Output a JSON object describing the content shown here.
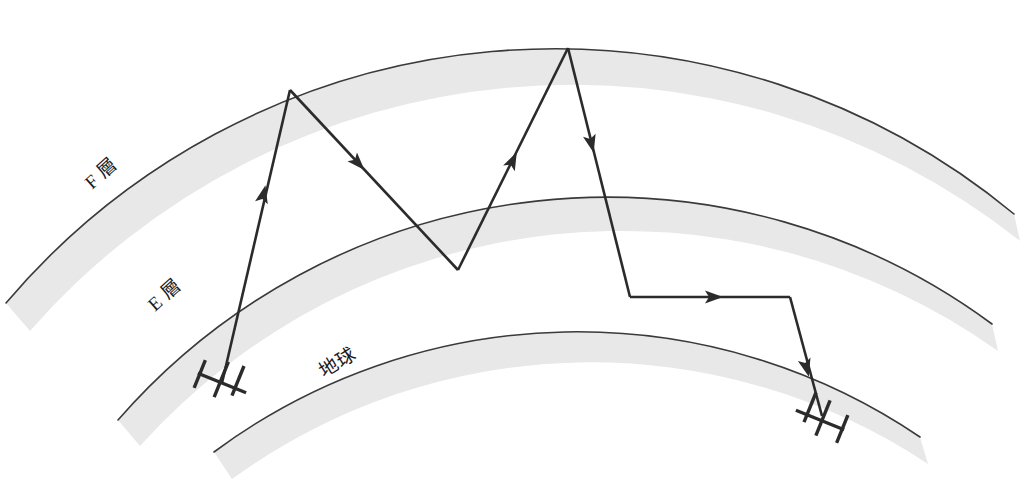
{
  "diagram": {
    "background_color": "#ffffff",
    "band_fill_color": "#e8e8e8",
    "line_color": "#2b2b2b",
    "edge_color": "#3a3a3a",
    "labels": [
      {
        "id": "f-layer",
        "text": "F 層",
        "x": 118,
        "y": 185,
        "rotation": -43
      },
      {
        "id": "e-layer",
        "text": "E 層",
        "x": 182,
        "y": 303,
        "rotation": -43
      },
      {
        "id": "earth",
        "text": "地球",
        "x": 345,
        "y": 371,
        "rotation": -33
      }
    ],
    "layers": [
      {
        "id": "f-layer-arc",
        "name": "F 層",
        "outer_path": "M 6,303 A 720,720 0 0 1 1014,214",
        "inner_path": "M 30,330 A 720,720 0 0 1 1020,240",
        "band_path": "M 6,303 A 720,720 0 0 1 1014,214 L 1020,240 A 720,720 0 0 0 30,330 Z"
      },
      {
        "id": "e-layer-arc",
        "name": "E 層",
        "outer_path": "M 118,420 A 640,640 0 0 1 988,322",
        "inner_path": "M 140,444 A 640,640 0 0 1 996,348",
        "band_path": "M 118,420 A 640,640 0 0 1 988,322 L 996,348 A 640,640 0 0 0 140,444 Z"
      },
      {
        "id": "earth-arc",
        "name": "地球",
        "outer_path": "M 214,452 A 600,600 0 0 1 918,435",
        "inner_path": "M 232,478 A 600,600 0 0 1 928,460",
        "band_path": "M 214,452 A 600,600 0 0 1 918,435 L 928,460 A 600,600 0 0 0 232,478 Z"
      }
    ],
    "rays": [
      {
        "id": "ray-hop-1-up",
        "from": "transmitter",
        "to": "f-layer-reflection-1",
        "path": "M 222,383 L 290,90",
        "arrows": [
          {
            "x": 266,
            "y": 180,
            "angle": -77
          }
        ]
      },
      {
        "id": "ray-hop-1-down",
        "from": "f-layer-reflection-1",
        "to": "e-layer-reflection",
        "path": "M 290,90 L 458,270",
        "arrows": [
          {
            "x": 367,
            "y": 151,
            "angle": 47
          }
        ]
      },
      {
        "id": "ray-hop-2-up",
        "from": "e-layer-reflection",
        "to": "f-layer-reflection-2",
        "path": "M 458,270 L 568,48",
        "arrows": [
          {
            "x": 514,
            "y": 148,
            "angle": -64
          }
        ]
      },
      {
        "id": "ray-hop-2-down",
        "from": "f-layer-reflection-2",
        "to": "ground-reflection",
        "path": "M 568,48 L 630,297",
        "arrows": [
          {
            "x": 591,
            "y": 138,
            "angle": 76
          }
        ]
      },
      {
        "id": "ray-ground-run",
        "from": "ground-reflection",
        "to": "receiver-turn",
        "path": "M 630,297 L 790,297",
        "arrows": [
          {
            "x": 712,
            "y": 297,
            "angle": 0
          }
        ]
      },
      {
        "id": "ray-to-receiver",
        "from": "receiver-turn",
        "to": "receiver",
        "path": "M 790,297 L 820,413",
        "arrows": [
          {
            "x": 808,
            "y": 374,
            "angle": 75
          }
        ]
      }
    ],
    "antennas": [
      {
        "id": "transmitter-antenna",
        "name": "transmitter",
        "x": 222,
        "y": 383,
        "rotation": 24,
        "flip": false
      },
      {
        "id": "receiver-antenna",
        "name": "receiver",
        "x": 818,
        "y": 420,
        "rotation": 24,
        "flip": true
      }
    ]
  }
}
